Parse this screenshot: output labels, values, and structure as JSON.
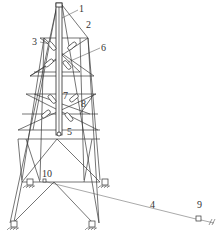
{
  "diagram": {
    "type": "structural tower / derrick schematic",
    "labels": [
      {
        "id": "1",
        "text": "1",
        "x": 80,
        "y": 10
      },
      {
        "id": "2",
        "text": "2",
        "x": 87,
        "y": 27
      },
      {
        "id": "3",
        "text": "3",
        "x": 33,
        "y": 44
      },
      {
        "id": "6",
        "text": "6",
        "x": 102,
        "y": 50
      },
      {
        "id": "7",
        "text": "7",
        "x": 64,
        "y": 98
      },
      {
        "id": "8",
        "text": "8",
        "x": 82,
        "y": 106
      },
      {
        "id": "5",
        "text": "5",
        "x": 68,
        "y": 134
      },
      {
        "id": "10",
        "text": "10",
        "x": 44,
        "y": 176
      },
      {
        "id": "4",
        "text": "4",
        "x": 151,
        "y": 207
      },
      {
        "id": "9",
        "text": "9",
        "x": 198,
        "y": 207
      }
    ],
    "components": [
      "mast",
      "upper-truss-frame",
      "inclined-hydraulic-cylinders",
      "guy-cable",
      "cable-anchor",
      "base-supports"
    ]
  }
}
